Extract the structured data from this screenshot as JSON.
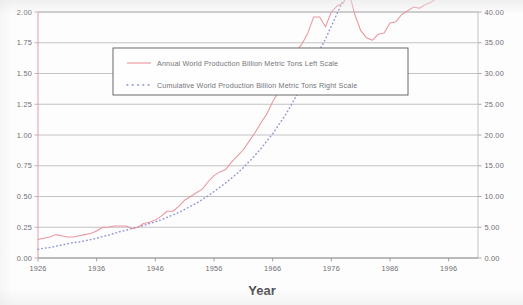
{
  "chart_data": {
    "type": "line",
    "title": "",
    "xlabel": "Year",
    "ylabel": "",
    "xlim": [
      1926,
      2001
    ],
    "x_ticks": [
      "1926",
      "1936",
      "1946",
      "1956",
      "1966",
      "1976",
      "1986",
      "1996"
    ],
    "x_tick_values": [
      1926,
      1936,
      1946,
      1956,
      1966,
      1976,
      1986,
      1996
    ],
    "left_axis": {
      "label": "Annual World Production Billion Metric Tons",
      "ylim": [
        0.0,
        2.0
      ],
      "tick_labels": [
        "0.00",
        "0.25",
        "0.50",
        "0.75",
        "1.00",
        "1.25",
        "1.50",
        "1.75",
        "2.00"
      ],
      "tick_values": [
        0.0,
        0.25,
        0.5,
        0.75,
        1.0,
        1.25,
        1.5,
        1.75,
        2.0
      ]
    },
    "right_axis": {
      "label": "Cumulative World Production Billion Metric Tons",
      "ylim": [
        0.0,
        40.0
      ],
      "tick_labels": [
        "0.00",
        "5.00",
        "10.00",
        "15.00",
        "20.00",
        "25.00",
        "30.00",
        "35.00",
        "40.00"
      ],
      "tick_values": [
        0.0,
        5.0,
        10.0,
        15.0,
        20.0,
        25.0,
        30.0,
        35.0,
        40.0
      ]
    },
    "grid": true,
    "legend_position": "upper-left-center",
    "series": [
      {
        "name": "Annual World Production Billion Metric Tons Left Scale",
        "axis": "left",
        "style": "solid",
        "color": "#e8909a",
        "x": [
          1926,
          1927,
          1928,
          1929,
          1930,
          1931,
          1932,
          1933,
          1934,
          1935,
          1936,
          1937,
          1938,
          1939,
          1940,
          1941,
          1942,
          1943,
          1944,
          1945,
          1946,
          1947,
          1948,
          1949,
          1950,
          1951,
          1952,
          1953,
          1954,
          1955,
          1956,
          1957,
          1958,
          1959,
          1960,
          1961,
          1962,
          1963,
          1964,
          1965,
          1966,
          1967,
          1968,
          1969,
          1970,
          1971,
          1972,
          1973,
          1974,
          1975,
          1976,
          1977,
          1978,
          1979,
          1980,
          1981,
          1982,
          1983,
          1984,
          1985,
          1986,
          1987,
          1988,
          1989,
          1990,
          1991,
          1992,
          1993,
          1994,
          1995,
          1996,
          1997,
          1998,
          1999,
          2000
        ],
        "values": [
          0.15,
          0.16,
          0.17,
          0.19,
          0.18,
          0.17,
          0.17,
          0.18,
          0.19,
          0.2,
          0.22,
          0.25,
          0.25,
          0.26,
          0.26,
          0.26,
          0.24,
          0.25,
          0.28,
          0.29,
          0.31,
          0.34,
          0.38,
          0.38,
          0.42,
          0.47,
          0.5,
          0.53,
          0.56,
          0.62,
          0.67,
          0.7,
          0.72,
          0.78,
          0.83,
          0.88,
          0.95,
          1.02,
          1.1,
          1.17,
          1.27,
          1.35,
          1.46,
          1.56,
          1.68,
          1.74,
          1.83,
          1.96,
          1.96,
          1.88,
          2.0,
          2.05,
          2.07,
          2.16,
          1.98,
          1.85,
          1.79,
          1.77,
          1.82,
          1.83,
          1.91,
          1.92,
          1.98,
          2.01,
          2.04,
          2.03,
          2.06,
          2.08,
          2.11,
          2.14,
          2.2,
          2.26,
          2.28,
          2.26,
          2.34
        ]
      },
      {
        "name": "Cumulative World Production  Billion Metric Tons  Right Scale",
        "axis": "right",
        "style": "dotted",
        "color": "#8a8fd0",
        "x": [
          1926,
          1927,
          1928,
          1929,
          1930,
          1931,
          1932,
          1933,
          1934,
          1935,
          1936,
          1937,
          1938,
          1939,
          1940,
          1941,
          1942,
          1943,
          1944,
          1945,
          1946,
          1947,
          1948,
          1949,
          1950,
          1951,
          1952,
          1953,
          1954,
          1955,
          1956,
          1957,
          1958,
          1959,
          1960,
          1961,
          1962,
          1963,
          1964,
          1965,
          1966,
          1967,
          1968,
          1969,
          1970,
          1971,
          1972,
          1973,
          1974,
          1975,
          1976,
          1977,
          1978,
          1979,
          1980,
          1981,
          1982,
          1983,
          1984,
          1985,
          1986,
          1987,
          1988,
          1989,
          1990,
          1991,
          1992,
          1993,
          1994,
          1995,
          1996,
          1997,
          1998,
          1999,
          2000
        ],
        "values": [
          1.4,
          1.6,
          1.7,
          1.9,
          2.1,
          2.3,
          2.5,
          2.6,
          2.8,
          3.0,
          3.2,
          3.5,
          3.7,
          4.0,
          4.3,
          4.5,
          4.8,
          5.0,
          5.3,
          5.6,
          5.9,
          6.2,
          6.6,
          7.0,
          7.4,
          7.9,
          8.4,
          8.9,
          9.5,
          10.1,
          10.8,
          11.5,
          12.2,
          13.0,
          13.8,
          14.7,
          15.7,
          16.7,
          17.8,
          19.0,
          20.2,
          21.6,
          23.0,
          24.6,
          26.3,
          28.0,
          29.9,
          31.8,
          33.8,
          35.6,
          37.7,
          39.8,
          41.9,
          44.0,
          46.0,
          47.9,
          49.7,
          51.5,
          53.3,
          55.1,
          57.0,
          59.0,
          61.0,
          63.0,
          65.0,
          67.1,
          69.2,
          71.3,
          73.4,
          75.5,
          77.7,
          80.0,
          82.3,
          84.5,
          86.9
        ]
      }
    ],
    "legend_entries": [
      {
        "label": "Annual World Production Billion Metric Tons Left Scale",
        "style": "solid",
        "color": "#e8909a"
      },
      {
        "label": "Cumulative World Production  Billion Metric Tons  Right Scale",
        "style": "dotted",
        "color": "#8a8fd0"
      }
    ],
    "colors": {
      "annual_line": "#e8909a",
      "cumulative_line": "#8a8fd0",
      "grid": "#9a9a9e",
      "axis": "#d9a7ae",
      "text": "#6f6f73"
    }
  }
}
